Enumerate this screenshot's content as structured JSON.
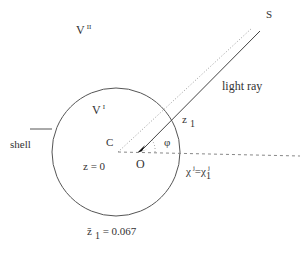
{
  "diagram": {
    "labels": {
      "region_outer": {
        "base": "V",
        "sup": "II"
      },
      "region_inner": {
        "base": "V",
        "sup": "I"
      },
      "source": "S",
      "ray": "light ray",
      "shell": "shell",
      "center": "C",
      "observer": "O",
      "center_redshift": "z = 0",
      "crossing_redshift": {
        "base": "z",
        "sub": "1"
      },
      "angle": "φ",
      "chi_eq": {
        "left": "χ",
        "left_sup": "j",
        "eq": "=",
        "right": "χ",
        "right_sup": "j",
        "right_sub": "1"
      },
      "zbar": {
        "base": "z̄",
        "sub": "1",
        "value": "= 0.067"
      }
    },
    "colors": {
      "stroke": "#555555",
      "dotted": "#888888",
      "dashed": "#777777"
    }
  }
}
